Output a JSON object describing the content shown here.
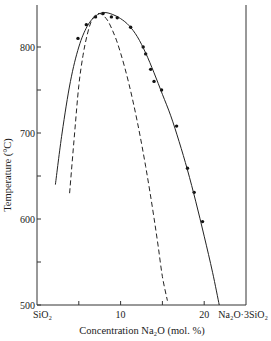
{
  "chart_data": {
    "type": "line",
    "title": "",
    "xlabel": "Concentration Na2O (mol. %)",
    "ylabel": "Temperature (°C)",
    "xlim": [
      0,
      25
    ],
    "ylim": [
      500,
      850
    ],
    "grid": false,
    "legend": null,
    "x_ticks": [
      0,
      5,
      10,
      15,
      20,
      25
    ],
    "x_tick_labels": [
      {
        "x": 0,
        "label": "SiO₂"
      },
      {
        "x": 10,
        "label": "10"
      },
      {
        "x": 20,
        "label": "20"
      },
      {
        "x": 25,
        "label": "Na₂O·3SiO₂"
      }
    ],
    "y_ticks": [
      500,
      550,
      600,
      650,
      700,
      750,
      800
    ],
    "y_tick_labels": [
      "500",
      "600",
      "700",
      "800"
    ],
    "series": [
      {
        "name": "measured points",
        "style": "markers",
        "x": [
          4.9,
          5.9,
          7.0,
          7.9,
          8.9,
          9.6,
          11.2,
          12.7,
          13.0,
          13.6,
          14.0,
          14.9,
          16.7,
          18.0,
          18.8,
          19.8
        ],
        "y": [
          810,
          826,
          835,
          839,
          835,
          834,
          823,
          800,
          792,
          774,
          760,
          750,
          708,
          659,
          631,
          597
        ]
      },
      {
        "name": "fitted curve",
        "style": "solid",
        "x": [
          2.2,
          3.0,
          4.0,
          5.0,
          6.0,
          7.0,
          8.0,
          9.0,
          10.0,
          11.0,
          12.0,
          13.0,
          14.0,
          15.0,
          16.0,
          17.0,
          18.0,
          19.0,
          20.0,
          21.0,
          21.8
        ],
        "y": [
          640,
          700,
          760,
          800,
          824,
          836,
          840,
          838,
          833,
          825,
          812,
          793,
          770,
          745,
          720,
          690,
          657,
          620,
          580,
          538,
          500
        ]
      },
      {
        "name": "calculated curve",
        "style": "dashed",
        "x": [
          3.9,
          4.5,
          5.0,
          5.5,
          6.0,
          6.5,
          7.0,
          7.5,
          8.0,
          8.5,
          9.0,
          9.5,
          10.0,
          10.5,
          11.0,
          11.5,
          12.0,
          12.5,
          13.0,
          13.5,
          14.0,
          14.5,
          15.0,
          15.6
        ],
        "y": [
          630,
          700,
          755,
          790,
          814,
          830,
          837,
          839,
          836,
          830,
          820,
          808,
          793,
          776,
          757,
          736,
          713,
          688,
          661,
          632,
          601,
          568,
          533,
          505
        ]
      }
    ]
  },
  "axes": {
    "xlabel": "Concentration Na₂O (mol. %)",
    "ylabel": "Temperature (°C)"
  }
}
